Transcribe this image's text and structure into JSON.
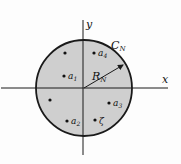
{
  "diagram": {
    "axes": {
      "x_label": "x",
      "y_label": "y"
    },
    "contour": {
      "label": "C",
      "subscript": "N"
    },
    "radius": {
      "label": "R",
      "subscript": "N"
    },
    "points": [
      {
        "id": "p-unlabeled-1",
        "label": "",
        "sub": ""
      },
      {
        "id": "a4",
        "label": "a",
        "sub": "4"
      },
      {
        "id": "a1",
        "label": "a",
        "sub": "1"
      },
      {
        "id": "p-unlabeled-2",
        "label": "",
        "sub": ""
      },
      {
        "id": "a3",
        "label": "a",
        "sub": "3"
      },
      {
        "id": "a2",
        "label": "a",
        "sub": "2"
      },
      {
        "id": "zeta",
        "label": "ζ",
        "sub": ""
      }
    ],
    "colors": {
      "disk_fill": "#cfcfcf",
      "stroke": "#1a1a1a",
      "background": "#fdfdfd"
    }
  }
}
